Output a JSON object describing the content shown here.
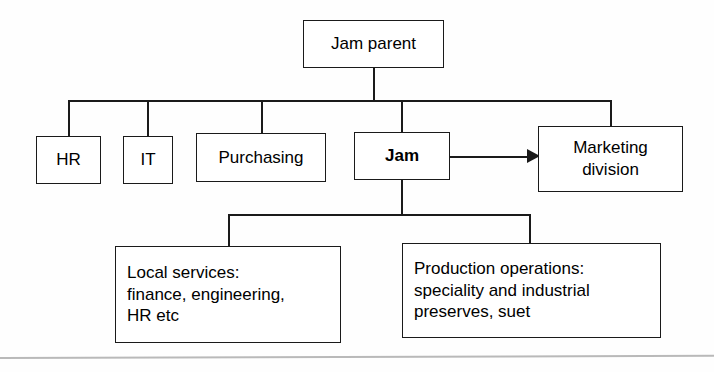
{
  "diagram": {
    "type": "organisation-chart",
    "orientation": "top-down",
    "line_color": "#1a1a1a",
    "box_fill": "#ffffff",
    "background": "#fefefe",
    "rule_color": "#b9b9b9",
    "nodes": {
      "jam_parent": {
        "label": "Jam parent",
        "level": 0,
        "bold": false,
        "align": "center"
      },
      "hr": {
        "label": "HR",
        "level": 1,
        "bold": false,
        "align": "center"
      },
      "it": {
        "label": "IT",
        "level": 1,
        "bold": false,
        "align": "center"
      },
      "purchasing": {
        "label": "Purchasing",
        "level": 1,
        "bold": false,
        "align": "center"
      },
      "jam": {
        "label": "Jam",
        "level": 1,
        "bold": true,
        "align": "center"
      },
      "marketing_division": {
        "label": "Marketing\ndivision",
        "level": 1,
        "bold": false,
        "align": "center"
      },
      "local_services": {
        "label": "Local services:\nfinance, engineering,\nHR etc",
        "level": 2,
        "bold": false,
        "align": "left"
      },
      "production_operations": {
        "label": "Production operations:\nspeciality and industrial\npreserves, suet",
        "level": 2,
        "bold": false,
        "align": "left"
      }
    },
    "edges": [
      {
        "from": "jam_parent",
        "to": "hr",
        "style": "orthogonal",
        "arrow": false
      },
      {
        "from": "jam_parent",
        "to": "it",
        "style": "orthogonal",
        "arrow": false
      },
      {
        "from": "jam_parent",
        "to": "purchasing",
        "style": "orthogonal",
        "arrow": false
      },
      {
        "from": "jam_parent",
        "to": "jam",
        "style": "orthogonal",
        "arrow": false
      },
      {
        "from": "jam_parent",
        "to": "marketing_division",
        "style": "orthogonal",
        "arrow": false
      },
      {
        "from": "jam",
        "to": "local_services",
        "style": "orthogonal",
        "arrow": false
      },
      {
        "from": "jam",
        "to": "production_operations",
        "style": "orthogonal",
        "arrow": false
      },
      {
        "from": "jam",
        "to": "marketing_division",
        "style": "straight",
        "arrow": true
      }
    ]
  }
}
